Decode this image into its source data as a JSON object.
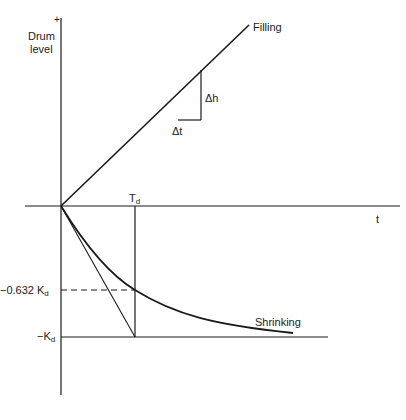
{
  "diagram": {
    "axes": {
      "y_axis_label_line1": "Drum",
      "y_axis_label_line2": "level",
      "y_axis_positive_marker": "+",
      "x_axis_label": "t"
    },
    "curves": {
      "filling_label": "Filling",
      "shrinking_label": "Shrinking"
    },
    "slope_triangle": {
      "delta_h_label": "Δh",
      "delta_t_label": "Δt"
    },
    "markers": {
      "time_constant_label": "T",
      "time_constant_subscript": "d",
      "level_0632_label": "−0.632 K",
      "level_0632_subscript": "d",
      "level_k_label": "−K",
      "level_k_subscript": "d"
    },
    "colors": {
      "line": "#1a1a1a",
      "text": "#222222",
      "background": "#ffffff"
    }
  }
}
